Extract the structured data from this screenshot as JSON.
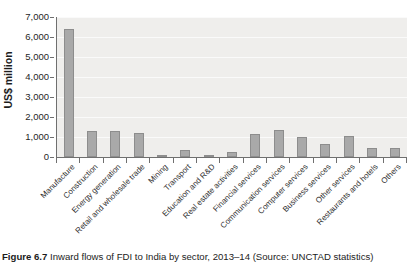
{
  "figure": {
    "caption_label": "Figure 6.7",
    "caption_text": "Inward flows of FDI to India by sector, 2013–14 (Source: UNCTAD statistics)"
  },
  "chart_data": {
    "type": "bar",
    "title": "",
    "subtitle": "",
    "xlabel": "",
    "ylabel": "US$ million",
    "ylim": [
      0,
      7000
    ],
    "ytick_labels": [
      "0",
      "1,000",
      "2,000",
      "3,000",
      "4,000",
      "5,000",
      "6,000",
      "7,000"
    ],
    "ytick_values": [
      0,
      1000,
      2000,
      3000,
      4000,
      5000,
      6000,
      7000
    ],
    "grid": true,
    "grid_orientation": "horizontal",
    "legend": false,
    "legend_position": "none",
    "bar_color": "#a9a9a9",
    "bar_edge_color": "#8d8d8d",
    "plot_background": "#efeeec",
    "categories": [
      "Manufacture",
      "Construction",
      "Energy generation",
      "Retail and wholesale trade",
      "Mining",
      "Transport",
      "Education and R&D",
      "Real estate activities",
      "Financial services",
      "Communication services",
      "Computer services",
      "Business services",
      "Other services",
      "Restaurants and hotels",
      "Others"
    ],
    "values": [
      6400,
      1300,
      1300,
      1180,
      50,
      370,
      80,
      250,
      1150,
      1350,
      1000,
      650,
      1050,
      470,
      430
    ]
  }
}
